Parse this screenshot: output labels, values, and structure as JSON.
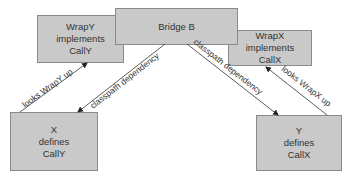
{
  "diagram": {
    "nodes": {
      "wrapy": {
        "lines": [
          "WrapY",
          "implements",
          "CallY"
        ]
      },
      "bridge": {
        "lines": [
          "Bridge B"
        ]
      },
      "wrapx": {
        "lines": [
          "WrapX",
          "implements",
          "CallX"
        ]
      },
      "x": {
        "lines": [
          "X",
          "defines",
          "CallY"
        ]
      },
      "y": {
        "lines": [
          "Y",
          "defines",
          "CallX"
        ]
      }
    },
    "edges": {
      "x_to_wrapy": {
        "label": "looks WrapY up"
      },
      "bridge_to_x": {
        "label": "classpath dependency"
      },
      "bridge_to_y": {
        "label": "classpath dependency"
      },
      "y_to_wrapx": {
        "label": "looks WrapX up"
      }
    },
    "colors": {
      "box_fill": "#c9c9c9",
      "box_border": "#8a8a8a",
      "line": "#333333"
    }
  }
}
